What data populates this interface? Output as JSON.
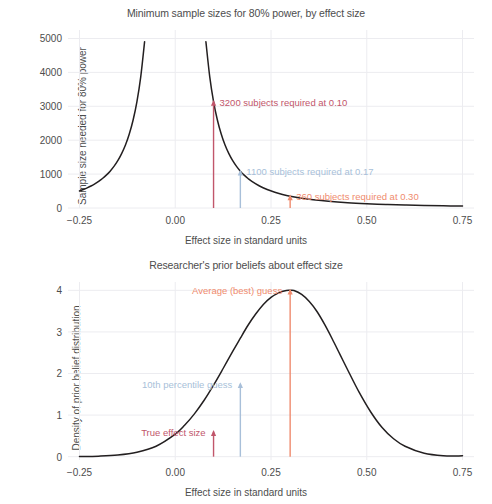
{
  "figure": {
    "xlabel": "Effect size in standard units",
    "axis_color": "#4d4d4d",
    "grid_color": "#ececf0",
    "curve_color": "#231f20",
    "colors": {
      "true_effect": "#c1566b",
      "tenth_percentile": "#a8bfd9",
      "average_guess": "#ef8b6e"
    }
  },
  "chart_data": [
    {
      "type": "line",
      "title": "Minimum sample sizes for 80% power, by effect size",
      "xlabel": "Effect size in standard units",
      "ylabel": "Sample size needed for 80% power",
      "xlim": [
        -0.28,
        0.78
      ],
      "ylim": [
        0,
        5250
      ],
      "xticks": [
        -0.25,
        0.0,
        0.25,
        0.5,
        0.75
      ],
      "xticklabels": [
        "−0.25",
        "0.00",
        "0.25",
        "0.50",
        "0.75"
      ],
      "yticks": [
        0,
        1000,
        2000,
        3000,
        4000,
        5000
      ],
      "yticklabels": [
        "0",
        "1000",
        "2000",
        "3000",
        "4000",
        "5000"
      ],
      "grid": true,
      "legend": "none",
      "formula": "n = 31.4 / d^2",
      "series": [
        {
          "name": "required sample size",
          "x": [
            -0.25,
            -0.24,
            -0.23,
            -0.22,
            -0.21,
            -0.2,
            -0.19,
            -0.18,
            -0.17,
            -0.16,
            -0.15,
            -0.14,
            -0.13,
            -0.12,
            -0.11,
            -0.1,
            -0.09,
            -0.08,
            -0.077,
            0.077,
            0.08,
            0.09,
            0.1,
            0.11,
            0.12,
            0.13,
            0.14,
            0.15,
            0.16,
            0.17,
            0.18,
            0.19,
            0.2,
            0.22,
            0.24,
            0.26,
            0.28,
            0.3,
            0.33,
            0.36,
            0.4,
            0.45,
            0.5,
            0.55,
            0.6,
            0.65,
            0.7,
            0.75
          ],
          "y": [
            502,
            545,
            594,
            648,
            712,
            785,
            869,
            969,
            1086,
            1227,
            1395,
            1602,
            1857,
            2181,
            2595,
            3140,
            3877,
            4906,
            5250,
            5250,
            4906,
            3877,
            3140,
            2595,
            2181,
            1857,
            1602,
            1395,
            1227,
            1086,
            969,
            869,
            785,
            649,
            545,
            464,
            401,
            349,
            288,
            242,
            196,
            155,
            126,
            104,
            87,
            74,
            64,
            56
          ]
        }
      ],
      "annotations": [
        {
          "label": "3200 subjects required at 0.10",
          "x": 0.1,
          "y": 3140,
          "color": "#c1566b"
        },
        {
          "label": "1100 subjects required at 0.17",
          "x": 0.17,
          "y": 1086,
          "color": "#a8bfd9"
        },
        {
          "label": "360 subjects required at 0.30",
          "x": 0.3,
          "y": 349,
          "color": "#ef8b6e"
        }
      ],
      "markers": [
        {
          "x": 0.1,
          "y_top": 3140,
          "color": "#c1566b"
        },
        {
          "x": 0.17,
          "y_top": 1086,
          "color": "#a8bfd9"
        },
        {
          "x": 0.3,
          "y_top": 349,
          "color": "#ef8b6e"
        }
      ]
    },
    {
      "type": "line",
      "title": "Researcher's prior beliefs about effect size",
      "xlabel": "Effect size in standard units",
      "ylabel": "Density of prior belief distribution",
      "xlim": [
        -0.28,
        0.78
      ],
      "ylim": [
        -0.08,
        4.2
      ],
      "xticks": [
        -0.25,
        0.0,
        0.25,
        0.5,
        0.75
      ],
      "xticklabels": [
        "−0.25",
        "0.00",
        "0.25",
        "0.50",
        "0.75"
      ],
      "yticks": [
        0,
        1,
        2,
        3,
        4
      ],
      "yticklabels": [
        "0",
        "1",
        "2",
        "3",
        "4"
      ],
      "grid": true,
      "legend": "none",
      "formula": "normal density, mean = 0.30, sd = 0.0997",
      "series": [
        {
          "name": "prior density",
          "x": [
            -0.25,
            -0.2,
            -0.15,
            -0.1,
            -0.05,
            0.0,
            0.025,
            0.05,
            0.075,
            0.1,
            0.125,
            0.15,
            0.17,
            0.19,
            0.21,
            0.23,
            0.25,
            0.27,
            0.29,
            0.3,
            0.31,
            0.33,
            0.35,
            0.37,
            0.39,
            0.41,
            0.43,
            0.45,
            0.48,
            0.51,
            0.54,
            0.57,
            0.6,
            0.65,
            0.7,
            0.75
          ],
          "y": [
            0.003,
            0.012,
            0.038,
            0.105,
            0.25,
            0.54,
            0.76,
            1.03,
            1.35,
            1.72,
            2.12,
            2.53,
            2.85,
            3.16,
            3.43,
            3.66,
            3.83,
            3.94,
            3.995,
            4.0,
            3.995,
            3.9,
            3.73,
            3.49,
            3.18,
            2.83,
            2.46,
            2.09,
            1.55,
            1.08,
            0.7,
            0.43,
            0.25,
            0.08,
            0.022,
            0.02
          ]
        }
      ],
      "annotations": [
        {
          "label": "Average (best) guess",
          "x": 0.3,
          "y": 4.0,
          "color": "#ef8b6e"
        },
        {
          "label": "10th percentile guess",
          "x": 0.17,
          "y": 1.75,
          "color": "#a8bfd9"
        },
        {
          "label": "True effect size",
          "x": 0.1,
          "y": 0.6,
          "color": "#c1566b"
        }
      ],
      "markers": [
        {
          "x": 0.1,
          "y_top": 0.6,
          "color": "#c1566b"
        },
        {
          "x": 0.17,
          "y_top": 1.75,
          "color": "#a8bfd9"
        },
        {
          "x": 0.3,
          "y_top": 4.0,
          "color": "#ef8b6e"
        }
      ]
    }
  ]
}
